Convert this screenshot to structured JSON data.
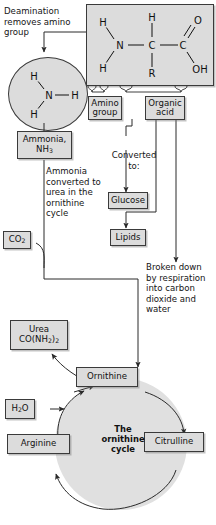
{
  "diagram": {
    "accent_fill": "#dcdcdc",
    "stroke_color": "#3a3a3a",
    "cycle_fill": "#e0e0e0"
  },
  "annotations": {
    "deamination": "Deamination removes amino group",
    "ammonia_converted": "Ammonia converted to urea in the ornithine cycle",
    "converted_to": "Converted to:",
    "broken_down": "Broken down by respiration into carbon dioxide and water"
  },
  "boxes": {
    "amino_group": "Amino group",
    "organic_acid": "Organic acid",
    "ammonia": "Ammonia, NH₃",
    "glucose": "Glucose",
    "lipids": "Lipids",
    "co2": "CO₂",
    "urea": "Urea CO(NH₂)₂",
    "h2o": "H₂O",
    "ornithine": "Ornithine",
    "citrulline": "Citrulline",
    "arginine": "Arginine",
    "cycle_label": "The ornithine cycle"
  },
  "structure": {
    "name": "amino-acid-structure",
    "atoms": [
      {
        "label": "H",
        "role": "amine-hydrogen-top"
      },
      {
        "label": "H",
        "role": "amine-hydrogen-bottom"
      },
      {
        "label": "N",
        "role": "nitrogen"
      },
      {
        "label": "C",
        "role": "alpha-carbon"
      },
      {
        "label": "H",
        "role": "alpha-hydrogen"
      },
      {
        "label": "R",
        "role": "side-chain"
      },
      {
        "label": "C",
        "role": "carboxyl-carbon"
      },
      {
        "label": "O",
        "role": "carbonyl-oxygen"
      },
      {
        "label": "OH",
        "role": "hydroxyl"
      }
    ]
  },
  "ammonia_molecule": {
    "center": "N",
    "hydrogens": [
      "H",
      "H",
      "H"
    ]
  },
  "cycle_steps": [
    "Ornithine",
    "Citrulline",
    "Arginine"
  ]
}
